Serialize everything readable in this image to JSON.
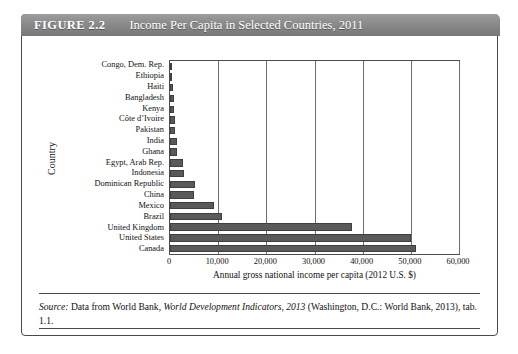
{
  "figure": {
    "number": "FIGURE 2.2",
    "title": "Income Per Capita in Selected Countries, 2011",
    "source_prefix": "Source:",
    "source_part1": " Data from World Bank, ",
    "source_italic": "World Development Indicators, 2013",
    "source_part2": " (Washington, D.C.: World Bank, 2013), tab. 1.1."
  },
  "chart_data": {
    "type": "bar",
    "orientation": "horizontal",
    "title": "Income Per Capita in Selected Countries, 2011",
    "xlabel": "Annual gross national income per capita (2012 U.S. $)",
    "ylabel": "Country",
    "xlim": [
      0,
      60000
    ],
    "xticks": [
      0,
      10000,
      20000,
      30000,
      40000,
      50000,
      60000
    ],
    "xticklabels": [
      "0",
      "10,000",
      "20,000",
      "30,000",
      "40,000",
      "50,000",
      "60,000"
    ],
    "grid": true,
    "legend": false,
    "bar_color": "#5a5a5a",
    "categories": [
      "Congo, Dem. Rep.",
      "Ethiopia",
      "Haiti",
      "Bangladesh",
      "Kenya",
      "Côte d’Ivoire",
      "Pakistan",
      "India",
      "Ghana",
      "Egypt, Arab Rep.",
      "Indonesia",
      "Dominican Republic",
      "China",
      "Mexico",
      "Brazil",
      "United Kingdom",
      "United States",
      "Canada"
    ],
    "values": [
      230,
      400,
      700,
      780,
      820,
      1100,
      1120,
      1420,
      1500,
      2600,
      3000,
      5200,
      5000,
      9200,
      10700,
      37800,
      50000,
      51000
    ]
  }
}
